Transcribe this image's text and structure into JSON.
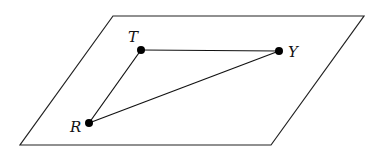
{
  "diagram": {
    "type": "geometry",
    "colors": {
      "stroke": "#111111",
      "background": "#ffffff"
    },
    "plane": {
      "corners": [
        [
          113,
          16
        ],
        [
          364,
          16
        ],
        [
          271,
          145
        ],
        [
          20,
          145
        ]
      ]
    },
    "points": [
      {
        "id": "T",
        "label": "T",
        "x": 141,
        "y": 50,
        "label_x": 128,
        "label_y": 42
      },
      {
        "id": "Y",
        "label": "Y",
        "x": 279,
        "y": 51,
        "label_x": 288,
        "label_y": 57
      },
      {
        "id": "R",
        "label": "R",
        "x": 89,
        "y": 123,
        "label_x": 70,
        "label_y": 132
      }
    ],
    "segments": [
      {
        "from": "T",
        "to": "Y"
      },
      {
        "from": "Y",
        "to": "R"
      },
      {
        "from": "R",
        "to": "T"
      }
    ]
  }
}
